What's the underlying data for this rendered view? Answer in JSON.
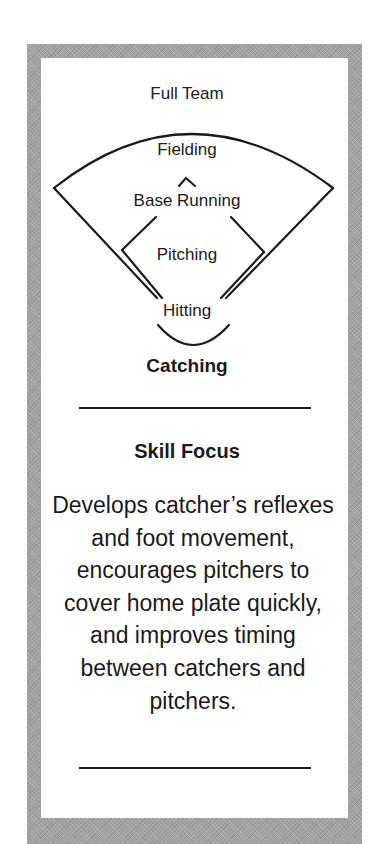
{
  "diagram": {
    "levels": [
      {
        "label": "Full Team"
      },
      {
        "label": "Fielding"
      },
      {
        "label": "Base Running"
      },
      {
        "label": "Pitching"
      },
      {
        "label": "Hitting"
      },
      {
        "label": "Catching",
        "highlighted": true
      }
    ]
  },
  "skill_focus": {
    "heading": "Skill Focus",
    "description": "Develops catcher’s reflexes and foot movement, encourages pitchers to cover home plate quickly, and improves timing between catchers and pitchers."
  },
  "colors": {
    "frame": "#a3a3a3",
    "ink": "#1a1a1a",
    "background": "#ffffff"
  }
}
